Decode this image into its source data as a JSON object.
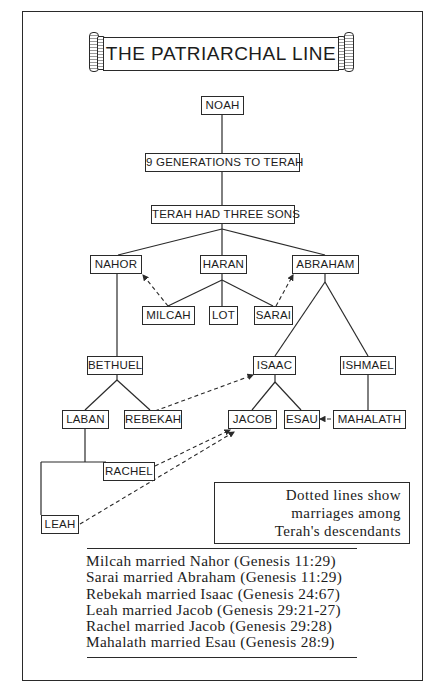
{
  "title": "THE PATRIARCHAL LINE",
  "nodes": {
    "noah": "NOAH",
    "generations": "9 GENERATIONS TO TERAH",
    "terah": "TERAH HAD THREE SONS",
    "nahor": "NAHOR",
    "haran": "HARAN",
    "abraham": "ABRAHAM",
    "milcah": "MILCAH",
    "lot": "LOT",
    "sarai": "SARAI",
    "bethuel": "BETHUEL",
    "isaac": "ISAAC",
    "ishmael": "ISHMAEL",
    "laban": "LABAN",
    "rebekah": "REBEKAH",
    "jacob": "JACOB",
    "esau": "ESAU",
    "mahalath": "MAHALATH",
    "rachel": "RACHEL",
    "leah": "LEAH"
  },
  "legend": {
    "lines": [
      "Dotted lines show",
      "marriages among",
      "Terah's descendants"
    ]
  },
  "marriages": [
    "Milcah married Nahor (Genesis 11:29)",
    "Sarai married Abraham (Genesis 11:29)",
    "Rebekah married Isaac (Genesis 24:67)",
    "Leah married Jacob (Genesis 29:21-27)",
    "Rachel married Jacob (Genesis 29:28)",
    "Mahalath married Esau (Genesis 28:9)"
  ],
  "colors": {
    "ink": "#1c1c1c",
    "paper": "#ffffff"
  }
}
